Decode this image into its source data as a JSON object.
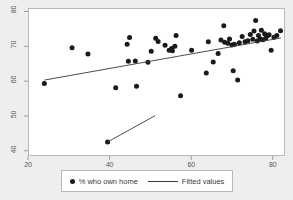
{
  "chart_data": {
    "type": "scatter",
    "title": "",
    "xlabel": "",
    "ylabel": "",
    "xlim": [
      20,
      83
    ],
    "ylim": [
      38.5,
      81
    ],
    "xticks": [
      20,
      40,
      60,
      80
    ],
    "yticks": [
      40,
      50,
      60,
      70,
      80
    ],
    "grid": false,
    "legend_position": "bottom",
    "background_color": "#eeeeee",
    "plot_background_color": "#ffffff",
    "marker_color": "#1a1a1a",
    "line_color": "#3a3a3a",
    "series": [
      {
        "name": "% who own home",
        "type": "scatter",
        "points": [
          [
            24.0,
            59.3
          ],
          [
            30.8,
            69.6
          ],
          [
            34.7,
            67.8
          ],
          [
            41.5,
            58.1
          ],
          [
            44.3,
            70.6
          ],
          [
            44.9,
            72.5
          ],
          [
            44.6,
            65.7
          ],
          [
            46.3,
            65.8
          ],
          [
            46.6,
            58.5
          ],
          [
            49.4,
            65.4
          ],
          [
            50.2,
            68.6
          ],
          [
            51.3,
            72.3
          ],
          [
            51.9,
            71.4
          ],
          [
            53.6,
            70.3
          ],
          [
            54.6,
            68.9
          ],
          [
            55.2,
            69.4
          ],
          [
            55.4,
            68.7
          ],
          [
            56.3,
            73.1
          ],
          [
            57.4,
            55.8
          ],
          [
            56.0,
            70.0
          ],
          [
            60.1,
            68.9
          ],
          [
            63.7,
            62.3
          ],
          [
            64.2,
            71.3
          ],
          [
            65.4,
            65.5
          ],
          [
            66.6,
            67.9
          ],
          [
            67.3,
            71.8
          ],
          [
            68.0,
            75.9
          ],
          [
            68.2,
            71.2
          ],
          [
            69.0,
            70.9
          ],
          [
            69.4,
            72.1
          ],
          [
            70.0,
            70.4
          ],
          [
            70.3,
            63.0
          ],
          [
            70.6,
            70.6
          ],
          [
            71.4,
            60.3
          ],
          [
            71.8,
            71.0
          ],
          [
            72.5,
            72.8
          ],
          [
            73.2,
            71.3
          ],
          [
            73.9,
            71.6
          ],
          [
            74.5,
            73.4
          ],
          [
            75.1,
            72.0
          ],
          [
            75.4,
            74.4
          ],
          [
            75.8,
            77.4
          ],
          [
            76.2,
            71.5
          ],
          [
            76.5,
            73.1
          ],
          [
            76.9,
            72.2
          ],
          [
            77.2,
            74.6
          ],
          [
            77.6,
            71.9
          ],
          [
            78.0,
            73.6
          ],
          [
            78.3,
            72.4
          ],
          [
            78.7,
            73.0
          ],
          [
            79.1,
            73.3
          ],
          [
            79.6,
            68.9
          ],
          [
            80.3,
            72.6
          ],
          [
            81.0,
            73.1
          ],
          [
            81.9,
            74.5
          ],
          [
            39.5,
            42.5
          ]
        ]
      },
      {
        "name": "Fitted values",
        "type": "line",
        "points": [
          [
            24.0,
            60.3
          ],
          [
            82.0,
            72.4
          ]
        ]
      },
      {
        "name": "Fitted values",
        "type": "line",
        "points": [
          [
            39.6,
            42.6
          ],
          [
            51.2,
            50.1
          ]
        ]
      }
    ]
  },
  "axes": {
    "x_tick_labels": [
      "20",
      "40",
      "60",
      "80"
    ],
    "y_tick_labels": [
      "40",
      "50",
      "60",
      "70",
      "80"
    ]
  },
  "legend": {
    "entries": [
      {
        "label": "% who own home",
        "marker": "dot-marker"
      },
      {
        "label": "Fitted values",
        "marker": "line-marker"
      }
    ]
  }
}
